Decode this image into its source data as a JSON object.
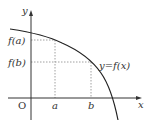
{
  "diagram": {
    "type": "function-graph",
    "axes": {
      "x_label": "x",
      "y_label": "y",
      "origin_label": "O"
    },
    "x_ticks": [
      {
        "label": "a"
      },
      {
        "label": "b"
      }
    ],
    "y_ticks": [
      {
        "label": "f(a)"
      },
      {
        "label": "f(b)"
      }
    ],
    "curve_label": "y=f(x)",
    "colors": {
      "axis": "#333333",
      "curve": "#222222",
      "guides": "#888888",
      "text": "#333333"
    }
  }
}
